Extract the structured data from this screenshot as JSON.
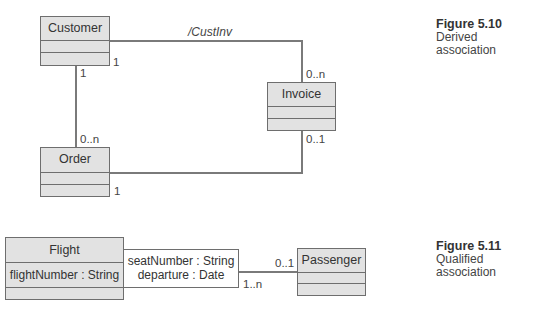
{
  "figure_5_10": {
    "caption": {
      "number": "Figure 5.10",
      "line1": "Derived",
      "line2": "association"
    },
    "classes": {
      "customer": {
        "name": "Customer"
      },
      "invoice": {
        "name": "Invoice"
      },
      "order": {
        "name": "Order"
      }
    },
    "associations": {
      "customer_invoice": {
        "role": "/CustInv",
        "customer_end": "1",
        "invoice_end": "0..n"
      },
      "customer_order": {
        "customer_end": "1",
        "order_end": "0..n"
      },
      "order_invoice": {
        "order_end": "1",
        "invoice_end": "0..1"
      }
    }
  },
  "figure_5_11": {
    "caption": {
      "number": "Figure 5.11",
      "line1": "Qualified",
      "line2": "association"
    },
    "classes": {
      "flight": {
        "name": "Flight",
        "attribute": "flightNumber : String"
      },
      "passenger": {
        "name": "Passenger"
      }
    },
    "qualifier": {
      "line1": "seatNumber : String",
      "line2": "departure : Date"
    },
    "association": {
      "flight_end": "1..n",
      "passenger_end": "0..1"
    }
  }
}
